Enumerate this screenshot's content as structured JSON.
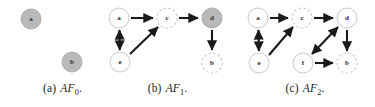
{
  "figure": {
    "type": "directed-graph-series",
    "panel_count": 3,
    "colors": {
      "node_fill_accepted": "#b9b9b9",
      "node_fill_default": "#ffffff",
      "node_stroke_solid": "#c9c9c9",
      "node_stroke_dashed": "#cfcfcf",
      "edge_color": "#1a1a1a",
      "label_color": "#2b2b2b",
      "background": "#ffffff"
    },
    "node_radius": 10
  },
  "panels": [
    {
      "id": "panel-a",
      "caption_index": "(a)",
      "caption_label": "AF",
      "caption_sub": "0",
      "caption_period": ".",
      "nodes": [
        {
          "id": "a",
          "label": "a",
          "cx": 31,
          "cy": 19,
          "style": "filled-solid"
        },
        {
          "id": "b",
          "label": "b",
          "cx": 72,
          "cy": 62,
          "style": "filled-solid"
        }
      ],
      "edges": []
    },
    {
      "id": "panel-b",
      "caption_index": "(b)",
      "caption_label": "AF",
      "caption_sub": "1",
      "caption_period": ".",
      "nodes": [
        {
          "id": "a",
          "label": "a",
          "cx": 19,
          "cy": 18,
          "style": "open-solid"
        },
        {
          "id": "c",
          "label": "c",
          "cx": 67,
          "cy": 18,
          "style": "open-dashed"
        },
        {
          "id": "d",
          "label": "d",
          "cx": 112,
          "cy": 18,
          "style": "filled-solid"
        },
        {
          "id": "e",
          "label": "e",
          "cx": 20,
          "cy": 62,
          "style": "open-solid"
        },
        {
          "id": "b",
          "label": "b",
          "cx": 112,
          "cy": 63,
          "style": "open-dashed"
        }
      ],
      "edges": [
        {
          "from": "a",
          "to": "c",
          "kind": "single"
        },
        {
          "from": "c",
          "to": "d",
          "kind": "single"
        },
        {
          "from": "a",
          "to": "e",
          "kind": "double"
        },
        {
          "from": "e",
          "to": "c",
          "kind": "single"
        },
        {
          "from": "d",
          "to": "b",
          "kind": "single"
        }
      ]
    },
    {
      "id": "panel-c",
      "caption_index": "(c)",
      "caption_label": "AF",
      "caption_sub": "2",
      "caption_period": ".",
      "nodes": [
        {
          "id": "a",
          "label": "a",
          "cx": 23,
          "cy": 18,
          "style": "open-solid"
        },
        {
          "id": "c",
          "label": "c",
          "cx": 67,
          "cy": 18,
          "style": "open-dashed"
        },
        {
          "id": "d",
          "label": "d",
          "cx": 112,
          "cy": 18,
          "style": "open-solid"
        },
        {
          "id": "e",
          "label": "e",
          "cx": 24,
          "cy": 63,
          "style": "open-solid"
        },
        {
          "id": "f",
          "label": "f",
          "cx": 68,
          "cy": 63,
          "style": "open-solid"
        },
        {
          "id": "b",
          "label": "b",
          "cx": 112,
          "cy": 63,
          "style": "open-dashed"
        }
      ],
      "edges": [
        {
          "from": "a",
          "to": "c",
          "kind": "single"
        },
        {
          "from": "c",
          "to": "d",
          "kind": "single"
        },
        {
          "from": "a",
          "to": "e",
          "kind": "double"
        },
        {
          "from": "e",
          "to": "c",
          "kind": "single"
        },
        {
          "from": "d",
          "to": "b",
          "kind": "single"
        },
        {
          "from": "d",
          "to": "f",
          "kind": "double"
        },
        {
          "from": "f",
          "to": "b",
          "kind": "single"
        }
      ]
    }
  ]
}
